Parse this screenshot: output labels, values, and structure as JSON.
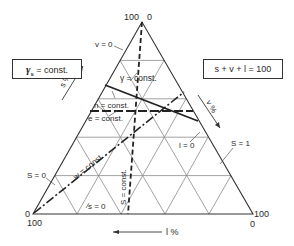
{
  "diagram": {
    "type": "ternary",
    "vertices": {
      "top": {
        "left_label": "100",
        "right_label": "0"
      },
      "bottom_left": {
        "top_label": "0",
        "bottom_label": "100"
      },
      "bottom_right": {
        "top_label": "100",
        "bottom_label": "0"
      }
    },
    "axes": {
      "left": {
        "label": "s %"
      },
      "right": {
        "label": "v %"
      },
      "bottom": {
        "label": "l %"
      }
    },
    "boxes": {
      "left": {
        "symbol": "γ",
        "subscript": "s",
        "text": "= const."
      },
      "right": {
        "text": "s + v + l = 100"
      }
    },
    "edge_labels": {
      "v0": "v = 0",
      "s0_left": "S = 0",
      "s1": "S = 1",
      "s0_bottom": "s = 0",
      "l0": "l = 0"
    },
    "curve_labels": {
      "gamma": "γ = const.",
      "n": "n = const.",
      "e": "e = const.",
      "w": "w = const.",
      "S": "S = const."
    },
    "colors": {
      "line": "#333333",
      "grid": "#888888",
      "background": "#ffffff"
    },
    "grid_divisions": 5
  }
}
